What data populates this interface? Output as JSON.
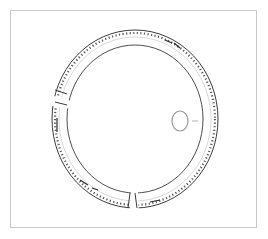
{
  "figure": {
    "type": "archaeological-line-drawing",
    "fragments": 3,
    "has_cross_section": true,
    "colors": {
      "frame": "#c8c8c8",
      "line": "#3a3a3a",
      "section": "#9a9a9a",
      "background": "#ffffff"
    }
  }
}
